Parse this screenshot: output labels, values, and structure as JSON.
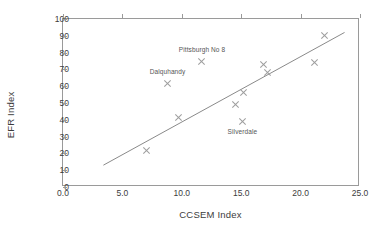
{
  "chart_data": {
    "type": "scatter",
    "title": "",
    "xlabel": "CCSEM Index",
    "ylabel": "EFR Index",
    "xlim": [
      0.0,
      25.0
    ],
    "ylim": [
      0,
      100
    ],
    "grid": false,
    "legend": false,
    "xticks": [
      "0.0",
      "5.0",
      "10.0",
      "15.0",
      "20.0",
      "25.0"
    ],
    "xtick_values": [
      0.0,
      5.0,
      10.0,
      15.0,
      20.0,
      25.0
    ],
    "yticks": [
      "0",
      "10",
      "20",
      "30",
      "40",
      "50",
      "60",
      "70",
      "80",
      "90",
      "100"
    ],
    "ytick_values": [
      0,
      10,
      20,
      30,
      40,
      50,
      60,
      70,
      80,
      90,
      100
    ],
    "marker": "x",
    "marker_color": "#9d9d9d",
    "points": [
      {
        "x": 7.0,
        "y": 21.5,
        "label": ""
      },
      {
        "x": 8.8,
        "y": 61.5,
        "label": "Dalquhandy"
      },
      {
        "x": 9.7,
        "y": 41.5,
        "label": ""
      },
      {
        "x": 11.7,
        "y": 75.0,
        "label": "Pittsburgh No 8"
      },
      {
        "x": 14.5,
        "y": 49.0,
        "label": ""
      },
      {
        "x": 15.1,
        "y": 39.0,
        "label": "Silverdale"
      },
      {
        "x": 15.2,
        "y": 56.5,
        "label": ""
      },
      {
        "x": 16.9,
        "y": 73.0,
        "label": ""
      },
      {
        "x": 17.2,
        "y": 68.0,
        "label": ""
      },
      {
        "x": 21.2,
        "y": 74.0,
        "label": ""
      },
      {
        "x": 22.0,
        "y": 90.0,
        "label": ""
      }
    ],
    "annotations": [
      {
        "text": "Pittsburgh No 8",
        "x": 11.7,
        "y": 81.5
      },
      {
        "text": "Dalquhandy",
        "x": 8.8,
        "y": 68.5
      },
      {
        "text": "Silverdale",
        "x": 15.1,
        "y": 32.5
      }
    ],
    "trendline": {
      "color": "#8a8a8a",
      "x0": 3.4,
      "y0": 13.0,
      "x1": 23.7,
      "y1": 92.0
    }
  }
}
